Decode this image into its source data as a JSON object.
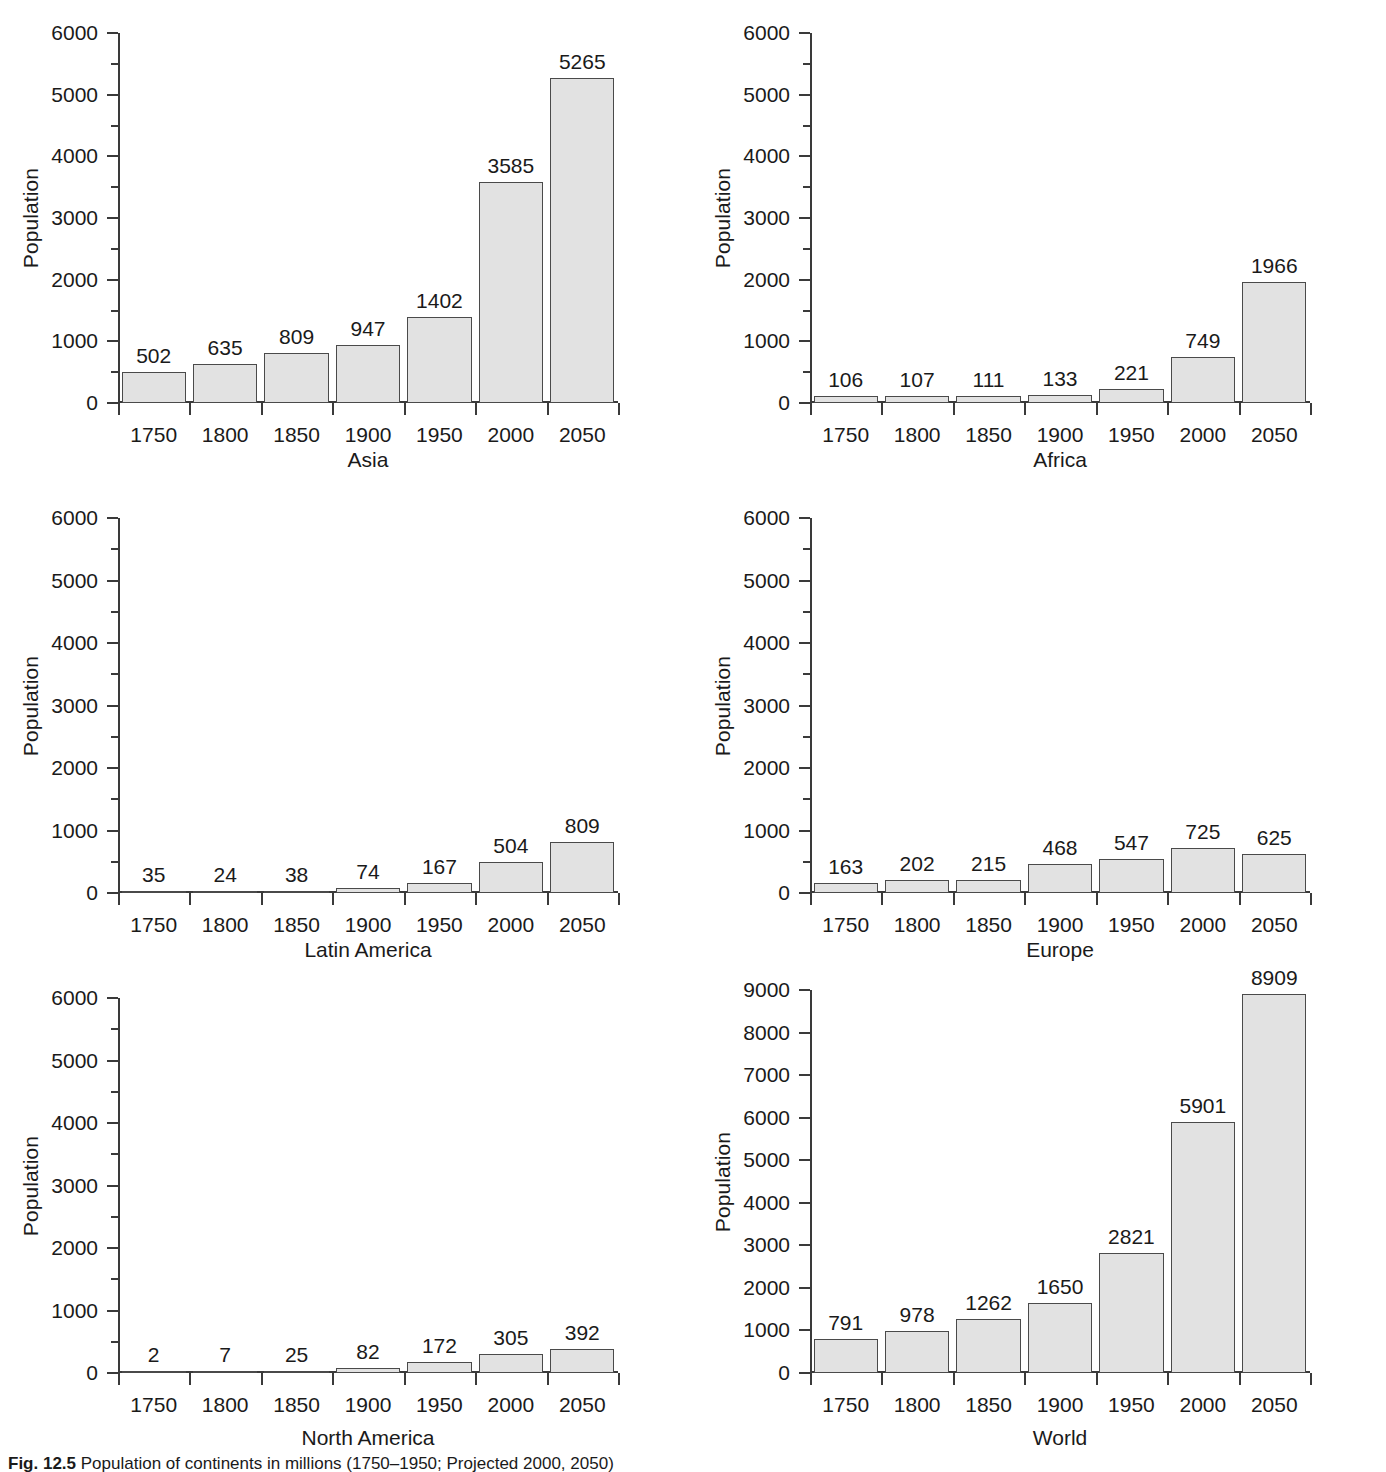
{
  "figure": {
    "caption_label": "Fig. 12.5",
    "caption_text": "Population of continents in millions (1750–1950; Projected 2000, 2050)",
    "axis_title_y": "Population",
    "bar_fill_color": "#e2e2e2",
    "bar_border_color": "#4a4a4a",
    "axis_color": "#3a3a3a",
    "background_color": "#ffffff"
  },
  "chart_data": [
    {
      "type": "bar",
      "title": "Asia",
      "xlabel": "Asia",
      "ylabel": "Population",
      "categories": [
        "1750",
        "1800",
        "1850",
        "1900",
        "1950",
        "2000",
        "2050"
      ],
      "values": [
        502,
        635,
        809,
        947,
        1402,
        3585,
        5265
      ],
      "ylim": [
        0,
        6000
      ],
      "yticks": [
        0,
        1000,
        2000,
        3000,
        4000,
        5000,
        6000
      ],
      "yminor_step": 500,
      "grid": false,
      "legend": "none"
    },
    {
      "type": "bar",
      "title": "Africa",
      "xlabel": "Africa",
      "ylabel": "Population",
      "categories": [
        "1750",
        "1800",
        "1850",
        "1900",
        "1950",
        "2000",
        "2050"
      ],
      "values": [
        106,
        107,
        111,
        133,
        221,
        749,
        1966
      ],
      "ylim": [
        0,
        6000
      ],
      "yticks": [
        0,
        1000,
        2000,
        3000,
        4000,
        5000,
        6000
      ],
      "yminor_step": 500,
      "grid": false,
      "legend": "none"
    },
    {
      "type": "bar",
      "title": "Latin America",
      "xlabel": "Latin America",
      "ylabel": "Population",
      "categories": [
        "1750",
        "1800",
        "1850",
        "1900",
        "1950",
        "2000",
        "2050"
      ],
      "values": [
        35,
        24,
        38,
        74,
        167,
        504,
        809
      ],
      "ylim": [
        0,
        6000
      ],
      "yticks": [
        0,
        1000,
        2000,
        3000,
        4000,
        5000,
        6000
      ],
      "yminor_step": 500,
      "grid": false,
      "legend": "none"
    },
    {
      "type": "bar",
      "title": "Europe",
      "xlabel": "Europe",
      "ylabel": "Population",
      "categories": [
        "1750",
        "1800",
        "1850",
        "1900",
        "1950",
        "2000",
        "2050"
      ],
      "values": [
        163,
        202,
        215,
        468,
        547,
        725,
        625
      ],
      "ylim": [
        0,
        6000
      ],
      "yticks": [
        0,
        1000,
        2000,
        3000,
        4000,
        5000,
        6000
      ],
      "yminor_step": 500,
      "grid": false,
      "legend": "none"
    },
    {
      "type": "bar",
      "title": "North America",
      "xlabel": "North America",
      "ylabel": "Population",
      "categories": [
        "1750",
        "1800",
        "1850",
        "1900",
        "1950",
        "2000",
        "2050"
      ],
      "values": [
        2,
        7,
        25,
        82,
        172,
        305,
        392
      ],
      "ylim": [
        0,
        6000
      ],
      "yticks": [
        0,
        1000,
        2000,
        3000,
        4000,
        5000,
        6000
      ],
      "yminor_step": 500,
      "grid": false,
      "legend": "none"
    },
    {
      "type": "bar",
      "title": "World",
      "xlabel": "World",
      "ylabel": "Population",
      "categories": [
        "1750",
        "1800",
        "1850",
        "1900",
        "1950",
        "2000",
        "2050"
      ],
      "values": [
        791,
        978,
        1262,
        1650,
        2821,
        5901,
        8909
      ],
      "ylim": [
        0,
        9000
      ],
      "yticks": [
        0,
        1000,
        2000,
        3000,
        4000,
        5000,
        6000,
        7000,
        8000,
        9000
      ],
      "yminor_step": 0,
      "grid": false,
      "legend": "none"
    }
  ]
}
